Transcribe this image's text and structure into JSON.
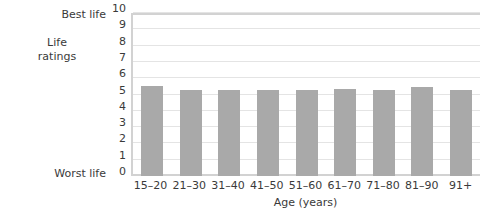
{
  "chart_data": {
    "type": "bar",
    "title": "",
    "xlabel": "Age (years)",
    "ylabel": "Life ratings",
    "categories": [
      "15–20",
      "21–30",
      "31–40",
      "41–50",
      "51–60",
      "61–70",
      "71–80",
      "81–90",
      "91+"
    ],
    "values": [
      5.6,
      5.35,
      5.35,
      5.35,
      5.35,
      5.4,
      5.35,
      5.5,
      5.35
    ],
    "ylim": [
      0,
      10
    ],
    "ytick_labels": [
      "0",
      "1",
      "2",
      "3",
      "4",
      "5",
      "6",
      "7",
      "8",
      "9",
      "10"
    ],
    "yaxis_endpoint_high": "Best life",
    "yaxis_endpoint_low": "Worst life",
    "ylabel_line1": "Life",
    "ylabel_line2": "ratings",
    "grid": true,
    "legend": "none",
    "bar_color": "#a9a9a9",
    "gridline_color": "#e4e4e4",
    "axis_color": "#d2d2d2",
    "background_color": "#ffffff"
  }
}
